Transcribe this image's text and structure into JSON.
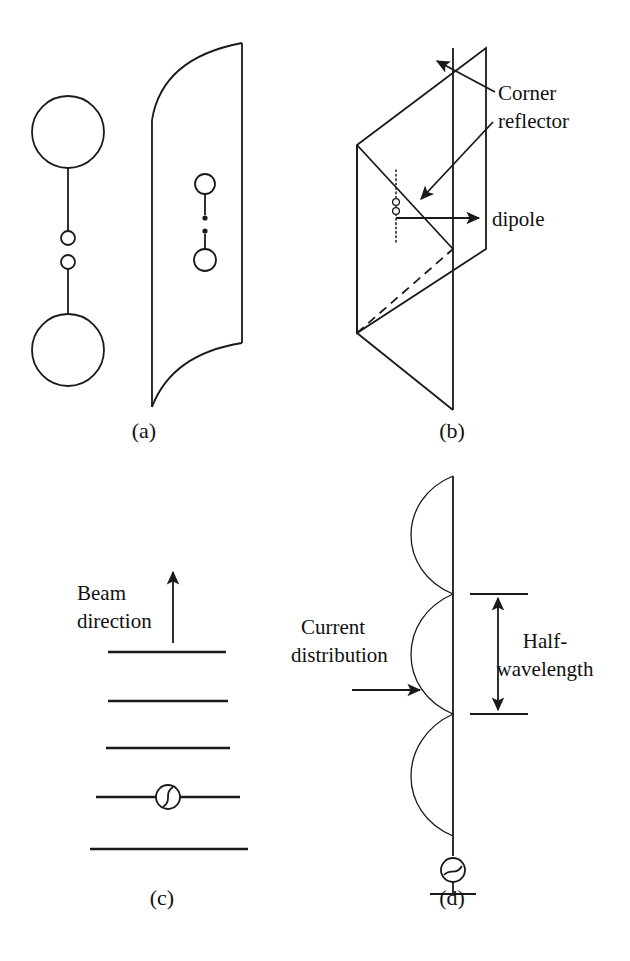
{
  "figure": {
    "kind": "line-diagram",
    "background_color": "#ffffff",
    "stroke_color": "#1a1a1a",
    "width": 630,
    "height": 961
  },
  "panels": [
    {
      "id": "a",
      "caption": "(a)",
      "caption_x": 144,
      "caption_y": 438,
      "title_semantic": "parabolic-dish-antenna",
      "labels": []
    },
    {
      "id": "b",
      "caption": "(b)",
      "caption_x": 452,
      "caption_y": 438,
      "title_semantic": "corner-reflector-antenna",
      "labels": [
        {
          "name": "corner-reflector-label",
          "line1": "Corner",
          "line2": "reflector",
          "x": 498,
          "y": 100
        },
        {
          "name": "dipole-label",
          "text": "dipole",
          "x": 492,
          "y": 232
        }
      ]
    },
    {
      "id": "c",
      "caption": "(c)",
      "caption_x": 144,
      "caption_y": 905,
      "title_semantic": "yagi-uda-antenna",
      "labels": [
        {
          "name": "beam-direction-label",
          "line1": "Beam",
          "line2": "direction",
          "x": 77,
          "y": 600
        }
      ]
    },
    {
      "id": "d",
      "caption": "(d)",
      "caption_x": 452,
      "caption_y": 905,
      "title_semantic": "vertical-collinear-antenna",
      "labels": [
        {
          "name": "current-distribution-label",
          "line1": "Current",
          "line2": "distribution",
          "x": 303,
          "y": 634
        },
        {
          "name": "half-wavelength-label",
          "line1": "Half-",
          "line2": "wavelength",
          "x": 525,
          "y": 640
        }
      ]
    }
  ],
  "panel_a": {
    "side_view": {
      "name": "dish-side-view",
      "upper_disc": {
        "cx": 68,
        "cy": 132,
        "r": 36
      },
      "lower_disc": {
        "cx": 68,
        "cy": 350,
        "r": 36
      },
      "upper_node": {
        "cx": 68,
        "cy": 238,
        "r": 7
      },
      "lower_node": {
        "cx": 68,
        "cy": 262,
        "r": 7
      },
      "upper_stem": {
        "x1": 68,
        "y1": 168,
        "x2": 68,
        "y2": 231
      },
      "lower_stem": {
        "x1": 68,
        "y1": 269,
        "x2": 68,
        "y2": 314
      }
    },
    "front_view": {
      "name": "dish-front-view",
      "right_edge": {
        "x": 242,
        "y_top": 43,
        "y_bottom": 343
      },
      "top_curve": "M152,120 Q160,60 242,43",
      "bottom_curve": "M242,343 Q170,356 152,406",
      "left_curve": "M152,120 L152,406"
    },
    "feed_dipole": {
      "name": "dish-feed-dipole",
      "upper_circle": {
        "cx": 205,
        "cy": 184,
        "r": 10
      },
      "lower_circle": {
        "cx": 205,
        "cy": 260,
        "r": 11
      },
      "upper_dot": {
        "cx": 205,
        "cy": 218,
        "r": 2.6
      },
      "lower_dot": {
        "cx": 205,
        "cy": 231,
        "r": 2.6
      },
      "upper_stem": {
        "x1": 205,
        "y1": 194,
        "x2": 205,
        "y2": 215
      },
      "lower_stem": {
        "x1": 205,
        "y1": 234,
        "x2": 205,
        "y2": 249
      }
    }
  },
  "panel_b": {
    "geometry_note": "corner reflector: two rectangular plates meeting at a vertical hinge, drawn in oblique projection",
    "back_plate": {
      "name": "corner-reflector-back-plate",
      "points": "357,145 472,59 472,248 357,333"
    },
    "hinge_edge": {
      "x1": 357,
      "y1": 145,
      "x2": 357,
      "y2": 333
    },
    "front_plate": {
      "name": "corner-reflector-front-plate",
      "points": "453,48 486,48 486,249 453,249"
    },
    "lower_plate": {
      "name": "corner-reflector-lower-plate",
      "points": "357,333 453,249 453,410 357,333"
    },
    "vertical_spine": {
      "x1": 453,
      "y1": 48,
      "x2": 453,
      "y2": 410
    },
    "top_ridge": {
      "x1": 357,
      "y1": 145,
      "x2": 486,
      "y2": 48
    },
    "mid_ridge": {
      "x1": 357,
      "y1": 145,
      "x2": 453,
      "y2": 249
    },
    "hidden_edge": {
      "x1": 357,
      "y1": 333,
      "x2": 453,
      "y2": 249
    },
    "right_edge": {
      "x1": 486,
      "y1": 48,
      "x2": 486,
      "y2": 249
    },
    "bottom_edge": {
      "x1": 357,
      "y1": 333,
      "x2": 453,
      "y2": 410
    },
    "dipole": {
      "name": "corner-reflector-dipole",
      "line": {
        "x1": 396,
        "y1": 172,
        "x2": 396,
        "y2": 240
      },
      "node_upper": {
        "cx": 396,
        "cy": 202,
        "r": 3.4
      },
      "node_lower": {
        "cx": 396,
        "cy": 211,
        "r": 3.4
      }
    },
    "leaders": [
      {
        "name": "corner-reflector-leader-upper",
        "path": "M495,92 L440,62",
        "arrow_at": "end"
      },
      {
        "name": "corner-reflector-leader-lower",
        "path": "M493,120 L423,197",
        "arrow_at": "end"
      },
      {
        "name": "dipole-leader",
        "path": "M396,218 L484,218",
        "arrow_at": "end"
      }
    ]
  },
  "panel_c": {
    "name": "yagi-element-stack",
    "elements": [
      {
        "name": "yagi-director-1",
        "x1": 108,
        "y1": 652,
        "x2": 226,
        "y2": 652
      },
      {
        "name": "yagi-director-2",
        "x1": 108,
        "y1": 701,
        "x2": 228,
        "y2": 701
      },
      {
        "name": "yagi-director-3",
        "x1": 106,
        "y1": 748,
        "x2": 230,
        "y2": 748
      },
      {
        "name": "yagi-driven-element",
        "x1": 96,
        "y1": 797,
        "x2": 240,
        "y2": 797
      },
      {
        "name": "yagi-reflector",
        "x1": 90,
        "y1": 849,
        "x2": 248,
        "y2": 849
      }
    ],
    "feed_source": {
      "name": "yagi-feed-source",
      "cx": 168,
      "cy": 797,
      "r": 12
    },
    "beam_arrow": {
      "name": "beam-direction-arrow",
      "x": 173,
      "y_tail": 643,
      "y_head": 570
    }
  },
  "panel_d": {
    "name": "collinear-antenna-mast",
    "mast": {
      "x": 453,
      "y_top": 476,
      "y_bottom": 856
    },
    "lobes": [
      {
        "name": "current-lobe-1",
        "path": "M453,476 C398,500 398,570 453,594"
      },
      {
        "name": "current-lobe-2",
        "path": "M453,594 C398,618 398,690 453,714"
      },
      {
        "name": "current-lobe-3",
        "path": "M453,714 C398,740 398,812 453,836"
      }
    ],
    "source": {
      "name": "antenna-feed-source",
      "cx": 453,
      "cy": 870,
      "r": 12
    },
    "ground": {
      "name": "ground-symbol",
      "x1": 430,
      "y1": 894,
      "x2": 476,
      "y2": 894,
      "stem_y1": 882,
      "stem_y2": 894
    },
    "dimension": {
      "name": "half-wavelength-dimension",
      "x": 498,
      "y_top": 594,
      "y_bottom": 714,
      "tick_x1": 470,
      "tick_x2": 528
    },
    "current_arrow": {
      "name": "current-distribution-arrow",
      "x_tail": 352,
      "x_head": 424,
      "y": 690
    }
  }
}
